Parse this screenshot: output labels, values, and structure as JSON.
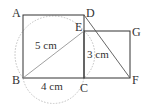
{
  "diagram": {
    "points": {
      "A": {
        "label": "A",
        "x": 23,
        "y": 15
      },
      "D": {
        "label": "D",
        "x": 84,
        "y": 15
      },
      "E": {
        "label": "E",
        "x": 84,
        "y": 31
      },
      "G": {
        "label": "G",
        "x": 130,
        "y": 31
      },
      "B": {
        "label": "B",
        "x": 23,
        "y": 78
      },
      "C": {
        "label": "C",
        "x": 84,
        "y": 78
      },
      "F": {
        "label": "F",
        "x": 130,
        "y": 78
      }
    },
    "measurements": {
      "BE": "5 cm",
      "EC": "3 cm",
      "BC": "4 cm"
    },
    "colors": {
      "line": "#333333",
      "thin_line": "#888888",
      "dotted_arc": "#bbbbbb"
    }
  }
}
